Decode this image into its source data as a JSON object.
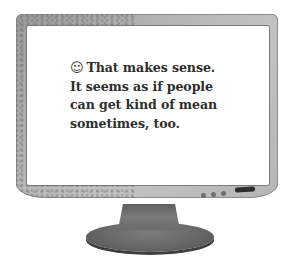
{
  "illustration": {
    "type": "computer-monitor",
    "screen": {
      "message": {
        "icon": "smiley-face-icon",
        "icon_glyph": "☺",
        "text": "That makes sense. It seems as if people can get kind of mean sometimes, too.",
        "lines": [
          "That makes sense.",
          "It seems as if people",
          "can get kind of mean",
          "sometimes, too."
        ]
      }
    },
    "bezel": {
      "indicator_lights": 3,
      "power_slot": true
    },
    "colors": {
      "bezel": "#b4b4b4",
      "screen": "#ffffff",
      "text": "#2e2e2e",
      "stand": "#666666"
    }
  }
}
